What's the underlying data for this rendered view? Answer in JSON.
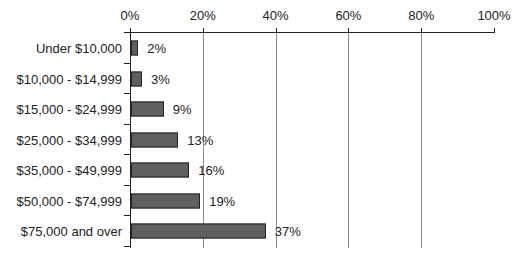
{
  "chart_data": {
    "type": "bar",
    "orientation": "horizontal",
    "title": "",
    "xlabel": "",
    "ylabel": "",
    "xlim": [
      0,
      100
    ],
    "x_ticks": [
      "0%",
      "20%",
      "40%",
      "60%",
      "80%",
      "100%"
    ],
    "x_tick_values": [
      0,
      20,
      40,
      60,
      80,
      100
    ],
    "axis_position": "top",
    "grid": true,
    "categories": [
      "Under $10,000",
      "$10,000 - $14,999",
      "$15,000 - $24,999",
      "$25,000 - $34,999",
      "$35,000 - $49,999",
      "$50,000 - $74,999",
      "$75,000 and over"
    ],
    "values": [
      2,
      3,
      9,
      13,
      16,
      19,
      37
    ],
    "value_labels": [
      "2%",
      "3%",
      "9%",
      "13%",
      "16%",
      "19%",
      "37%"
    ],
    "bar_color": "#606060",
    "legend": null
  }
}
